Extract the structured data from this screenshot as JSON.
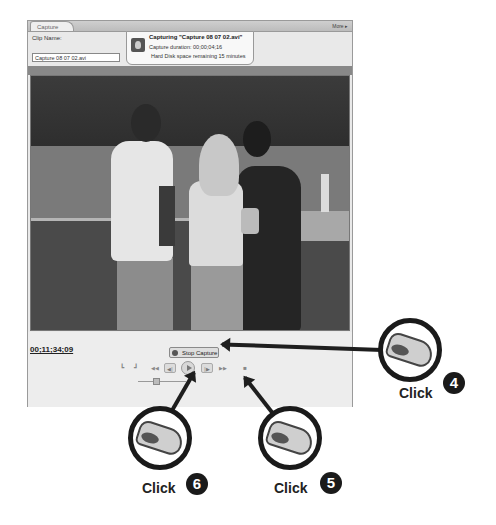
{
  "panel": {
    "tab_label": "Capture",
    "more_label": "More ▸",
    "clip_name_label": "Clip Name:",
    "clip_name_value": "Capture 08 07 02.avi"
  },
  "status": {
    "icon": "capture-camera-icon",
    "title": "Capturing \"Capture 08 07 02.avi\"",
    "duration": "Capture duration: 00;00;04;16",
    "disk": "Hard Disk space remaining 15 minutes"
  },
  "controls": {
    "timecode": "00;11;34;09",
    "stop_capture_label": "Stop Capture",
    "transport": [
      {
        "name": "set-in-point",
        "glyph": "┗"
      },
      {
        "name": "set-out-point",
        "glyph": "┛"
      },
      {
        "name": "rewind",
        "glyph": "◀◀"
      },
      {
        "name": "step-back",
        "glyph": "◀|"
      },
      {
        "name": "play",
        "glyph": ""
      },
      {
        "name": "step-forward",
        "glyph": "|▶"
      },
      {
        "name": "fast-forward",
        "glyph": "▶▶"
      },
      {
        "name": "stop",
        "glyph": "■"
      }
    ]
  },
  "callouts": [
    {
      "label": "Click",
      "step": "4"
    },
    {
      "label": "Click",
      "step": "5"
    },
    {
      "label": "Click",
      "step": "6"
    }
  ],
  "colors": {
    "panel_bg": "#e9e9e9",
    "border": "#9a9a9a",
    "callout": "#1a1a1a"
  }
}
